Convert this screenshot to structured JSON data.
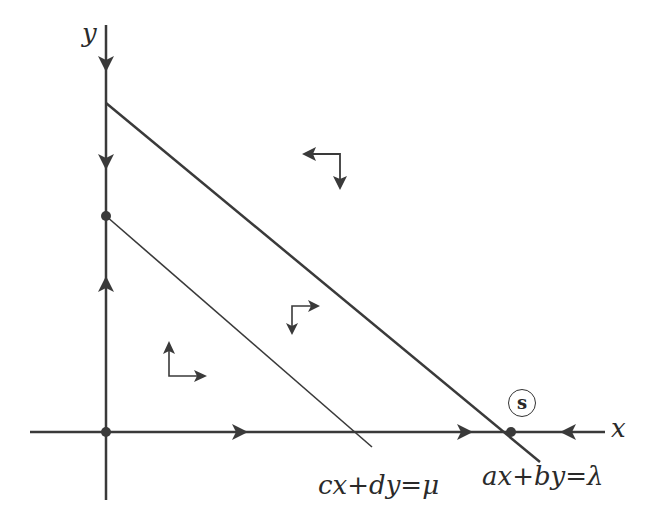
{
  "diagram": {
    "type": "phase-portrait",
    "axes": {
      "x_label": "x",
      "y_label": "y"
    },
    "lines": [
      {
        "id": "outer",
        "equation": "ax+by=λ"
      },
      {
        "id": "inner",
        "equation": "cx+dy=μ"
      }
    ],
    "equilibrium_points": [
      {
        "id": "origin",
        "location": "intersection of axes"
      },
      {
        "id": "y-intercept",
        "location": "inner line meets y-axis"
      },
      {
        "id": "s",
        "label": "s",
        "location": "outer line meets x-axis"
      }
    ],
    "axis_flow": {
      "y_axis": [
        "down",
        "down",
        "up"
      ],
      "x_axis": [
        "right",
        "right",
        "left"
      ]
    },
    "region_vectors": [
      {
        "region": "above outer line",
        "horizontal": "left",
        "vertical": "down"
      },
      {
        "region": "between lines",
        "horizontal": "right",
        "vertical": "down"
      },
      {
        "region": "below inner line",
        "horizontal": "right",
        "vertical": "up"
      }
    ],
    "colors": {
      "stroke": "#3a3a3a",
      "background": "#ffffff"
    }
  }
}
